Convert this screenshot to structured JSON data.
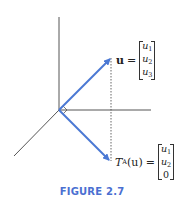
{
  "figure": {
    "caption": "FIGURE 2.7",
    "colors": {
      "axis": "#555555",
      "vector": "#4a78d4",
      "dashed": "#555555",
      "caption": "#4a6fd1"
    },
    "vector_u": {
      "name": "u",
      "equals": "=",
      "components": [
        "u",
        "u",
        "u"
      ],
      "subscripts": [
        "1",
        "2",
        "3"
      ]
    },
    "vector_TAu": {
      "func": "T",
      "func_sub": "A",
      "arg": "(u)",
      "equals": "=",
      "components": [
        "u",
        "u",
        "0"
      ],
      "subscripts": [
        "1",
        "2",
        ""
      ]
    }
  }
}
